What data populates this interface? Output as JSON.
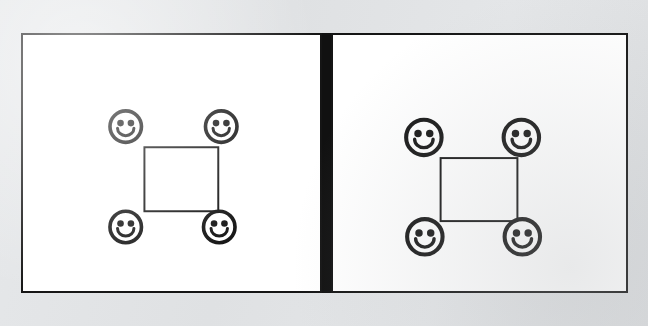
{
  "image": {
    "title": "Two-panel diagram of four smiley faces arranged at the corners of a square",
    "background_color": "#e3e5e7",
    "ink_color": "#161616",
    "panel_fill_color": "#ffffff",
    "panel_count": 2
  },
  "divider": {
    "name": "center-divider",
    "color": "#111111",
    "x": 322,
    "y": 33,
    "width": 9,
    "height": 260
  },
  "panels": [
    {
      "id": "left-panel",
      "label": "Left panel",
      "x": 21,
      "y": 33,
      "width": 301,
      "height": 260,
      "border_color": "#151515",
      "border_width": 2,
      "fill": "#ffffff",
      "square": {
        "name": "center-square",
        "x": 123,
        "y": 114,
        "width": 75,
        "height": 65,
        "stroke": "#161616",
        "stroke_width": 2
      },
      "faces": [
        {
          "id": "face-top-left",
          "position": "top-left",
          "cx": 104,
          "cy": 93,
          "r": 16,
          "expression": "smiley"
        },
        {
          "id": "face-top-right",
          "position": "top-right",
          "cx": 201,
          "cy": 93,
          "r": 16,
          "expression": "smiley"
        },
        {
          "id": "face-bottom-left",
          "position": "bottom-left",
          "cx": 104,
          "cy": 195,
          "r": 16,
          "expression": "smiley"
        },
        {
          "id": "face-bottom-right",
          "position": "bottom-right",
          "cx": 199,
          "cy": 195,
          "r": 16,
          "expression": "smiley"
        }
      ]
    },
    {
      "id": "right-panel",
      "label": "Right panel",
      "x": 331,
      "y": 33,
      "width": 297,
      "height": 260,
      "border_color": "#151515",
      "border_width": 2,
      "fill": "#ffffff",
      "square": {
        "name": "center-square",
        "x": 109,
        "y": 125,
        "width": 78,
        "height": 64,
        "stroke": "#161616",
        "stroke_width": 2
      },
      "faces": [
        {
          "id": "face-top-left",
          "position": "top-left",
          "cx": 92,
          "cy": 104,
          "r": 18,
          "expression": "smiley"
        },
        {
          "id": "face-top-right",
          "position": "top-right",
          "cx": 191,
          "cy": 104,
          "r": 18,
          "expression": "smiley"
        },
        {
          "id": "face-bottom-left",
          "position": "bottom-left",
          "cx": 93,
          "cy": 205,
          "r": 18,
          "expression": "smiley"
        },
        {
          "id": "face-bottom-right",
          "position": "bottom-right",
          "cx": 192,
          "cy": 205,
          "r": 18,
          "expression": "smiley"
        }
      ]
    }
  ],
  "face_style": {
    "stroke_width_ratio": 0.115,
    "eye_offset_x_ratio": 0.33,
    "eye_offset_y_ratio": 0.22,
    "eye_radius_ratio": 0.105,
    "mouth_radius_ratio": 0.52,
    "mouth_stroke_ratio": 0.095
  }
}
